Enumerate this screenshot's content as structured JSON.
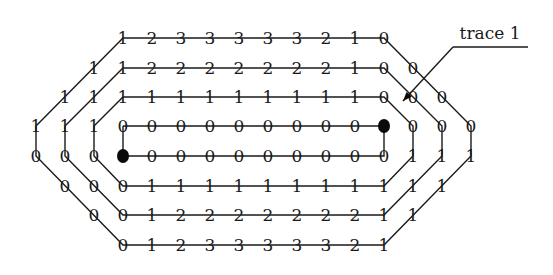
{
  "label": {
    "text": "trace 1"
  },
  "grid": {
    "col_origin_x": 123,
    "col_step": 29,
    "row_y": [
      38,
      68,
      97,
      126,
      156,
      186,
      215,
      245
    ]
  },
  "rows": [
    {
      "row": 0,
      "cells": [
        [
          0,
          "1"
        ],
        [
          1,
          "2"
        ],
        [
          2,
          "3"
        ],
        [
          3,
          "3"
        ],
        [
          4,
          "3"
        ],
        [
          5,
          "3"
        ],
        [
          6,
          "3"
        ],
        [
          7,
          "2"
        ],
        [
          8,
          "1"
        ],
        [
          9,
          "0"
        ]
      ]
    },
    {
      "row": 1,
      "cells": [
        [
          -1,
          "1"
        ],
        [
          0,
          "1"
        ],
        [
          1,
          "2"
        ],
        [
          2,
          "2"
        ],
        [
          3,
          "2"
        ],
        [
          4,
          "2"
        ],
        [
          5,
          "2"
        ],
        [
          6,
          "2"
        ],
        [
          7,
          "2"
        ],
        [
          8,
          "1"
        ],
        [
          9,
          "0"
        ],
        [
          10,
          "0"
        ]
      ]
    },
    {
      "row": 2,
      "cells": [
        [
          -2,
          "1"
        ],
        [
          -1,
          "1"
        ],
        [
          0,
          "1"
        ],
        [
          1,
          "1"
        ],
        [
          2,
          "1"
        ],
        [
          3,
          "1"
        ],
        [
          4,
          "1"
        ],
        [
          5,
          "1"
        ],
        [
          6,
          "1"
        ],
        [
          7,
          "1"
        ],
        [
          8,
          "1"
        ],
        [
          9,
          "0"
        ],
        [
          10,
          "0"
        ],
        [
          11,
          "0"
        ]
      ]
    },
    {
      "row": 3,
      "cells": [
        [
          -3,
          "1"
        ],
        [
          -2,
          "1"
        ],
        [
          -1,
          "1"
        ],
        [
          0,
          "0"
        ],
        [
          1,
          "0"
        ],
        [
          2,
          "0"
        ],
        [
          3,
          "0"
        ],
        [
          4,
          "0"
        ],
        [
          5,
          "0"
        ],
        [
          6,
          "0"
        ],
        [
          7,
          "0"
        ],
        [
          8,
          "0"
        ],
        [
          9,
          "●"
        ],
        [
          10,
          "0"
        ],
        [
          11,
          "0"
        ],
        [
          12,
          "0"
        ]
      ]
    },
    {
      "row": 4,
      "cells": [
        [
          -3,
          "0"
        ],
        [
          -2,
          "0"
        ],
        [
          -1,
          "0"
        ],
        [
          0,
          "●"
        ],
        [
          1,
          "0"
        ],
        [
          2,
          "0"
        ],
        [
          3,
          "0"
        ],
        [
          4,
          "0"
        ],
        [
          5,
          "0"
        ],
        [
          6,
          "0"
        ],
        [
          7,
          "0"
        ],
        [
          8,
          "0"
        ],
        [
          9,
          "0"
        ],
        [
          10,
          "1"
        ],
        [
          11,
          "1"
        ],
        [
          12,
          "1"
        ]
      ]
    },
    {
      "row": 5,
      "cells": [
        [
          -2,
          "0"
        ],
        [
          -1,
          "0"
        ],
        [
          0,
          "0"
        ],
        [
          1,
          "1"
        ],
        [
          2,
          "1"
        ],
        [
          3,
          "1"
        ],
        [
          4,
          "1"
        ],
        [
          5,
          "1"
        ],
        [
          6,
          "1"
        ],
        [
          7,
          "1"
        ],
        [
          8,
          "1"
        ],
        [
          9,
          "1"
        ],
        [
          10,
          "1"
        ],
        [
          11,
          "1"
        ]
      ]
    },
    {
      "row": 6,
      "cells": [
        [
          -1,
          "0"
        ],
        [
          0,
          "0"
        ],
        [
          1,
          "1"
        ],
        [
          2,
          "2"
        ],
        [
          3,
          "2"
        ],
        [
          4,
          "2"
        ],
        [
          5,
          "2"
        ],
        [
          6,
          "2"
        ],
        [
          7,
          "2"
        ],
        [
          8,
          "2"
        ],
        [
          9,
          "1"
        ],
        [
          10,
          "1"
        ]
      ]
    },
    {
      "row": 7,
      "cells": [
        [
          0,
          "0"
        ],
        [
          1,
          "1"
        ],
        [
          2,
          "2"
        ],
        [
          3,
          "3"
        ],
        [
          4,
          "3"
        ],
        [
          5,
          "3"
        ],
        [
          6,
          "3"
        ],
        [
          7,
          "3"
        ],
        [
          8,
          "2"
        ],
        [
          9,
          "1"
        ]
      ]
    }
  ],
  "terminals": [
    {
      "name": "terminal-top-right",
      "col": 9,
      "row": 3
    },
    {
      "name": "terminal-bottom-left",
      "col": 0,
      "row": 4
    }
  ],
  "traces": [
    {
      "name": "trace-ring-1",
      "points": [
        [
          0,
          3
        ],
        [
          9,
          3
        ],
        [
          9,
          4
        ],
        [
          0,
          4
        ],
        [
          0,
          3
        ]
      ]
    },
    {
      "name": "trace-ring-2",
      "points": [
        [
          -1,
          3
        ],
        [
          0,
          2
        ],
        [
          9,
          2
        ],
        [
          10,
          3
        ],
        [
          10,
          4
        ],
        [
          9,
          5
        ],
        [
          0,
          5
        ],
        [
          -1,
          4
        ],
        [
          -1,
          3
        ]
      ]
    },
    {
      "name": "trace-ring-3",
      "points": [
        [
          -2,
          3
        ],
        [
          0,
          1
        ],
        [
          9,
          1
        ],
        [
          11,
          3
        ],
        [
          11,
          4
        ],
        [
          9,
          6
        ],
        [
          0,
          6
        ],
        [
          -2,
          4
        ],
        [
          -2,
          3
        ]
      ]
    },
    {
      "name": "trace-ring-4",
      "points": [
        [
          -3,
          3
        ],
        [
          0,
          0
        ],
        [
          9,
          0
        ],
        [
          12,
          3
        ],
        [
          12,
          4
        ],
        [
          9,
          7
        ],
        [
          0,
          7
        ],
        [
          -3,
          4
        ],
        [
          -3,
          3
        ]
      ]
    }
  ],
  "callout": {
    "text_x": 490,
    "text_y": 39,
    "underline": [
      [
        453,
        47
      ],
      [
        528,
        47
      ]
    ],
    "arrow_to": [
      403,
      101
    ]
  }
}
